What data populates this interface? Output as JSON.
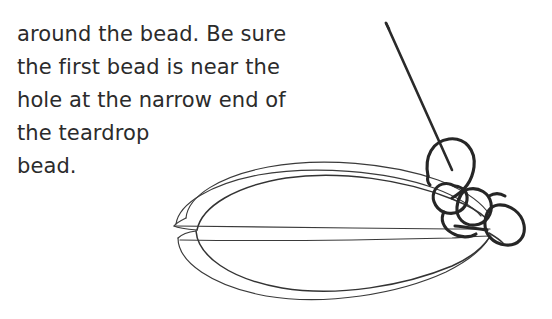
{
  "page": {
    "background_color": "#ffffff",
    "ink_color": "#2e2e2e",
    "width": 552,
    "height": 319
  },
  "instruction": {
    "text": "around the bead. Be sure\nthe first bead is near the\nhole at the narrow end of\nthe teardrop\nbead.",
    "lines": [
      "around the bead. Be sure",
      "the first bead is near the",
      "hole at the narrow end of",
      "the teardrop",
      "bead."
    ]
  },
  "illustration": {
    "caption": "hand-drawn beading diagram",
    "elements": [
      {
        "name": "needle",
        "description": "straight sewing needle angled from upper-left down to lower-right, passing through the thread loop"
      },
      {
        "name": "thread-loop-large",
        "description": "large open loop of thread at top of the bead cluster"
      },
      {
        "name": "seed-bead-1",
        "description": "small round seed bead drawn as a loop"
      },
      {
        "name": "seed-bead-2",
        "description": "small round seed bead drawn as a loop"
      },
      {
        "name": "seed-bead-3",
        "description": "small round seed bead drawn as a loop at far right"
      },
      {
        "name": "teardrop-bead",
        "description": "large teardrop/lens shaped bead with narrow end on the left and hole at the right"
      },
      {
        "name": "thread-through-bead",
        "description": "thread lines running horizontally through the teardrop bead"
      }
    ]
  }
}
